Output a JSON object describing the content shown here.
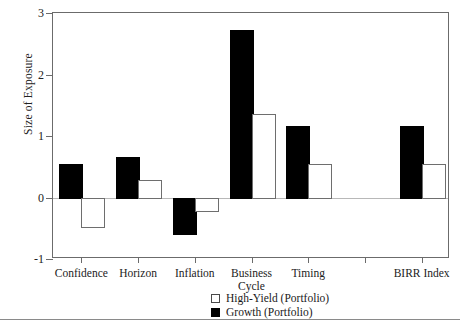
{
  "chart_data": {
    "type": "bar",
    "title": "",
    "xlabel": "",
    "ylabel": "Size of Exposure",
    "ylim": [
      -1,
      3
    ],
    "yticks": [
      -1,
      0,
      1,
      2,
      3
    ],
    "ytick_labels": [
      "-1",
      "0",
      "1",
      "2",
      "3"
    ],
    "grid": false,
    "zero_line": true,
    "legend_position": "bottom-center",
    "categories": [
      "Confidence",
      "Horizon",
      "Inflation",
      "Business Cycle",
      "Timing",
      "",
      "BIRR Index"
    ],
    "category_labels_display": [
      "Confidence",
      "Horizon",
      "Inflation",
      "Business\nCycle",
      "Timing",
      "",
      "BIRR Index"
    ],
    "series": [
      {
        "name": "Growth (Portfolio)",
        "color": "#000000",
        "style": "filled",
        "values": [
          0.55,
          0.66,
          -0.57,
          2.72,
          1.17,
          null,
          1.17
        ]
      },
      {
        "name": "High-Yield (Portfolio)",
        "color": "#ffffff",
        "style": "outline",
        "values": [
          -0.47,
          0.29,
          -0.21,
          1.36,
          0.54,
          null,
          0.54
        ]
      }
    ]
  },
  "axis": {
    "y_title": "Size of Exposure",
    "y_tick_labels": [
      "3",
      "2",
      "1",
      "0",
      "-1"
    ],
    "x_tick_labels": [
      "Confidence",
      "Horizon",
      "Inflation",
      "Business",
      "Cycle",
      "Timing",
      "BIRR Index"
    ]
  },
  "legend": {
    "items": [
      {
        "label": "High-Yield (Portfolio)",
        "swatch": "open-square-icon"
      },
      {
        "label": "Growth (Portfolio)",
        "swatch": "filled-square-icon"
      }
    ]
  },
  "footer": {
    "smudge_text": ""
  }
}
